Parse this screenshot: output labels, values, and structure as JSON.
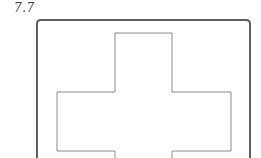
{
  "figure": {
    "label": "7.7",
    "shape": "cross-inside-rounded-frame"
  },
  "frame": {
    "x": 37,
    "y": 20,
    "right": 250,
    "radius": 4,
    "stroke": "#5f5f5f",
    "stroke_width": 2
  },
  "cross": {
    "stroke": "#8a8a8a",
    "stroke_width": 1,
    "points": "115,33 172,33 172,92 231,92 231,151 172,151 172,158 115,158 115,151 57,151 57,92 115,92"
  }
}
